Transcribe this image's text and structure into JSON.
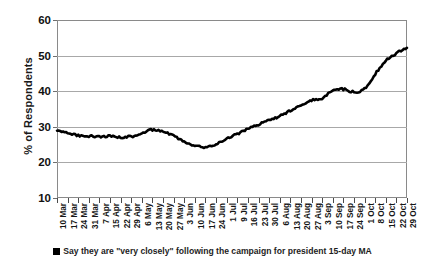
{
  "chart_data": {
    "type": "line",
    "title": "",
    "xlabel": "",
    "ylabel": "% of Respondents",
    "ylim": [
      10,
      60
    ],
    "yticks": [
      10,
      20,
      30,
      40,
      50,
      60
    ],
    "grid": true,
    "legend_position": "bottom",
    "series_name": "Say they are \"very closely\" following the campaign for president 15-day MA",
    "series_color": "#000000",
    "categories": [
      "10 Mar",
      "17 Mar",
      "24 Mar",
      "31 Mar",
      "7 Apr",
      "15 Apr",
      "22 Apr",
      "29 Apr",
      "6 May",
      "13 May",
      "20 May",
      "27 May",
      "3 Jun",
      "10 Jun",
      "17 Jun",
      "24 Jun",
      "1 Jul",
      "9 Jul",
      "16 Jul",
      "23 Jul",
      "30 Jul",
      "6 Aug",
      "13 Aug",
      "20 Aug",
      "27 Aug",
      "3 Sep",
      "10 Sep",
      "17 Sep",
      "24 Sep",
      "1 Oct",
      "8 Oct",
      "15 Oct",
      "22 Oct",
      "29 Oct"
    ],
    "values": [
      29.0,
      28.2,
      27.6,
      27.4,
      27.2,
      27.4,
      27.0,
      27.3,
      28.2,
      29.2,
      28.6,
      27.4,
      26.0,
      24.6,
      24.4,
      25.2,
      26.8,
      28.0,
      29.4,
      30.6,
      31.8,
      33.0,
      34.6,
      36.2,
      37.4,
      38.0,
      40.2,
      40.6,
      39.8,
      40.6,
      44.8,
      48.6,
      50.6,
      52.2
    ],
    "value_axis_note": "15-day moving average, daily resolution rendered as a dense noisy line"
  },
  "legend": {
    "marker": "square-marker",
    "label": "Say they are \"very closely\" following the campaign for president 15-day MA"
  },
  "axes": {
    "y_title": "% of Respondents"
  }
}
